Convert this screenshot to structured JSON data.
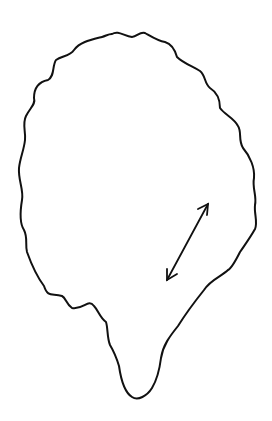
{
  "figure": {
    "stroke_color": "#111111",
    "background": "#ffffff",
    "arrow": {
      "type": "double-headed",
      "from": [
        166,
        281
      ],
      "to": [
        209,
        203
      ]
    }
  }
}
